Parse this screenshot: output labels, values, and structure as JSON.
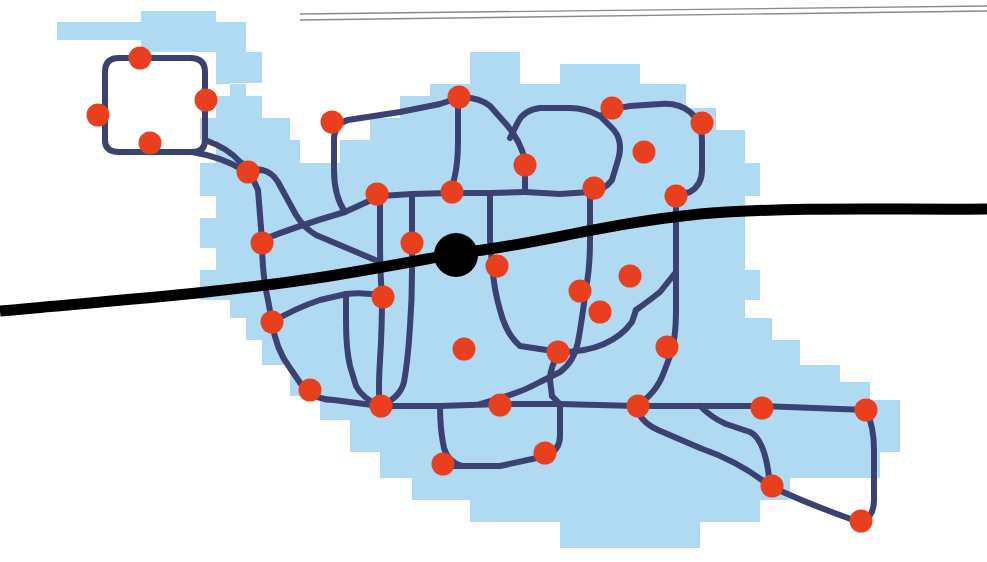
{
  "figure": {
    "width": 987,
    "height": 562,
    "background_color": "#ffffff"
  },
  "legend_colors": {
    "region_fill": "#b0daf1",
    "network_link": "#3b4271",
    "station_node": "#e8401e",
    "corridor": "#000000",
    "hub_node": "#000000",
    "rule": "#8a8a8a"
  },
  "layers": [
    {
      "name": "district-region",
      "label": "Shaded district area",
      "color": "#b0daf1"
    },
    {
      "name": "rail-network",
      "label": "Rail network links",
      "color": "#3b4271"
    },
    {
      "name": "stations",
      "label": "Stations",
      "color": "#e8401e"
    },
    {
      "name": "main-corridor",
      "label": "Main corridor",
      "color": "#000000"
    },
    {
      "name": "central-hub",
      "label": "Central hub",
      "color": "#000000"
    }
  ],
  "chart_data": {
    "type": "diagram",
    "region_polygon": "M 57,22 L 141,22 L 141,11 L 216,11 L 216,22 L 246,22 L 246,52 L 262,52 L 262,83 L 230,83 L 230,96 L 216,96 L 216,118 L 200,118 L 200,140 L 216,140 L 216,163 L 200,163 L 200,196 L 216,196 L 216,218 L 200,218 L 200,248 L 216,248 L 216,270 L 200,270 L 200,300 L 230,300 L 230,318 L 246,318 L 246,340 L 262,340 L 262,365 L 290,365 L 290,396 L 320,396 L 320,420 L 350,420 L 350,452 L 380,452 L 380,478 L 412,478 L 412,500 L 470,500 L 470,522 L 560,522 L 560,548 L 700,548 L 700,522 L 760,522 L 760,500 L 790,500 L 790,478 L 880,478 L 880,452 L 900,452 L 900,400 L 870,400 L 870,382 L 840,382 L 840,365 L 800,365 L 800,340 L 772,340 L 772,318 L 745,318 L 745,300 L 760,300 L 760,270 L 745,270 L 745,196 L 760,196 L 760,163 L 745,163 L 745,130 L 716,130 L 716,108 L 686,108 L 686,84 L 640,84 L 640,64 L 560,64 L 560,84 L 520,84 L 520,52 L 470,52 L 470,84 L 430,84 L 430,96 L 400,96 L 400,118 L 370,118 L 370,140 L 340,140 L 340,163 L 300,163 L 300,140 L 290,140 L 290,118 L 262,118 L 262,96 L 246,96 L 246,84 L 216,84 L 216,52 L 141,52 L 141,40 L 57,40 Z",
    "corridor_path": "M 0,311 C 120,300 230,292 330,276 C 420,261 450,254 475,251 C 540,243 610,223 700,214 C 800,206 900,210 987,209",
    "corridor_width": 11,
    "hub": {
      "x": 456,
      "y": 255,
      "r": 22,
      "label": "central-hub"
    },
    "rules": [
      {
        "x1": 300,
        "y1": 14,
        "x2": 987,
        "y2": 6,
        "width": 1.4
      },
      {
        "x1": 300,
        "y1": 20,
        "x2": 987,
        "y2": 11,
        "width": 1.4
      }
    ],
    "link_width": 6,
    "links": [
      "M 105,115 L 105,72 Q 105,58 119,58 L 190,58 Q 205,58 205,72 L 205,140 Q 205,152 192,152 L 162,152 L 119,152 Q 105,152 105,140 Z",
      "M 205,140 Q 228,148 240,162 L 248,172",
      "M 192,152 Q 222,157 243,170 L 252,178",
      "M 248,172 Q 254,180 258,190 L 262,240",
      "M 248,172 L 262,170 Q 272,172 278,182 L 296,215 Q 304,228 316,235 L 380,262",
      "M 262,240 Q 262,275 268,300 L 272,322",
      "M 272,322 Q 276,350 290,368 L 305,390",
      "M 305,390 Q 318,400 334,400 L 380,406",
      "M 380,406 L 440,406 L 500,404 L 560,404 L 636,406 L 700,406 L 762,406 L 866,410",
      "M 262,240 Q 300,225 345,212 L 380,196",
      "M 380,196 L 412,194 L 450,193 L 490,193 L 525,192",
      "M 380,196 L 380,240 Q 380,272 382,296",
      "M 382,296 Q 382,330 380,360 Q 378,392 380,406",
      "M 412,194 L 412,240 L 412,272",
      "M 412,272 Q 412,300 410,326 Q 408,360 404,382 Q 400,398 380,406",
      "M 345,212 Q 334,196 334,170 L 334,140 Q 334,124 348,120 L 400,112 Q 420,108 440,104 L 458,98",
      "M 458,98 Q 478,96 490,106 L 506,124 Q 520,140 525,160 L 525,192",
      "M 458,98 L 458,140 Q 458,170 452,186 L 450,193",
      "M 525,192 L 560,194 L 590,192",
      "M 590,192 Q 605,190 612,180 L 618,160 Q 624,140 612,128 L 600,116 Q 614,108 630,106 L 660,104 Q 678,102 690,112 Q 702,122 702,140 L 702,170 Q 702,185 690,192 L 676,196",
      "M 600,116 Q 585,108 570,108 L 540,108 Q 524,110 518,122 L 510,138",
      "M 590,192 L 590,240 Q 590,268 586,288",
      "M 586,288 Q 582,320 578,342 Q 574,362 560,372 L 540,382 Q 522,392 500,398 L 480,404",
      "M 676,196 L 676,240 L 676,272 L 676,310 Q 676,340 670,356 L 664,372 Q 656,394 636,406",
      "M 636,406 Q 640,422 658,430 L 700,448",
      "M 700,448 Q 740,462 770,486",
      "M 770,486 Q 810,505 862,523",
      "M 862,523 Q 874,516 874,500 L 874,450 Q 874,426 866,410",
      "M 700,406 Q 712,418 726,424 L 750,432 Q 766,440 770,486",
      "M 490,193 L 490,240 L 492,264",
      "M 492,264 Q 494,290 500,310 Q 506,334 520,346 L 560,352",
      "M 560,352 Q 586,352 604,344 Q 622,336 632,322 L 636,310",
      "M 636,310 Q 650,300 660,292 L 676,272",
      "M 560,352 Q 550,366 550,380 L 552,396",
      "M 552,396 L 560,404",
      "M 272,322 Q 296,308 320,300 L 346,294 Q 366,292 382,296",
      "M 262,170 Q 250,168 240,162",
      "M 346,294 L 346,322 Q 346,348 350,366 L 356,386 Q 362,398 380,406",
      "M 440,406 Q 440,430 444,448 Q 448,462 462,466 L 500,466 L 546,456 Q 560,450 560,436 L 560,416",
      "M 560,416 L 560,404",
      "M 462,466 L 440,466",
      "M 105,115 L 105,140",
      "M 700,406 L 762,406"
    ],
    "stations": [
      {
        "id": "s1",
        "x": 140,
        "y": 58,
        "label": "station-1"
      },
      {
        "id": "s2",
        "x": 98,
        "y": 115,
        "label": "station-2"
      },
      {
        "id": "s3",
        "x": 206,
        "y": 100,
        "label": "station-3"
      },
      {
        "id": "s4",
        "x": 150,
        "y": 143,
        "label": "station-4"
      },
      {
        "id": "s5",
        "x": 248,
        "y": 172,
        "label": "station-5"
      },
      {
        "id": "s6",
        "x": 332,
        "y": 122,
        "label": "station-6"
      },
      {
        "id": "s7",
        "x": 459,
        "y": 97,
        "label": "station-7"
      },
      {
        "id": "s8",
        "x": 612,
        "y": 108,
        "label": "station-8"
      },
      {
        "id": "s9",
        "x": 702,
        "y": 123,
        "label": "station-9"
      },
      {
        "id": "s10",
        "x": 525,
        "y": 165,
        "label": "station-10"
      },
      {
        "id": "s11",
        "x": 644,
        "y": 152,
        "label": "station-11"
      },
      {
        "id": "s12",
        "x": 377,
        "y": 194,
        "label": "station-12"
      },
      {
        "id": "s13",
        "x": 452,
        "y": 192,
        "label": "station-13"
      },
      {
        "id": "s14",
        "x": 594,
        "y": 188,
        "label": "station-14"
      },
      {
        "id": "s15",
        "x": 676,
        "y": 196,
        "label": "station-15"
      },
      {
        "id": "s16",
        "x": 262,
        "y": 243,
        "label": "station-16"
      },
      {
        "id": "s17",
        "x": 412,
        "y": 243,
        "label": "station-17"
      },
      {
        "id": "s18",
        "x": 497,
        "y": 266,
        "label": "station-18"
      },
      {
        "id": "s19",
        "x": 630,
        "y": 276,
        "label": "station-19"
      },
      {
        "id": "s20",
        "x": 272,
        "y": 322,
        "label": "station-20"
      },
      {
        "id": "s21",
        "x": 383,
        "y": 297,
        "label": "station-21"
      },
      {
        "id": "s22",
        "x": 580,
        "y": 291,
        "label": "station-22"
      },
      {
        "id": "s23",
        "x": 600,
        "y": 312,
        "label": "station-23"
      },
      {
        "id": "s24",
        "x": 464,
        "y": 349,
        "label": "station-24"
      },
      {
        "id": "s25",
        "x": 558,
        "y": 352,
        "label": "station-25"
      },
      {
        "id": "s26",
        "x": 667,
        "y": 347,
        "label": "station-26"
      },
      {
        "id": "s27",
        "x": 310,
        "y": 390,
        "label": "station-27"
      },
      {
        "id": "s28",
        "x": 381,
        "y": 406,
        "label": "station-28"
      },
      {
        "id": "s29",
        "x": 500,
        "y": 405,
        "label": "station-29"
      },
      {
        "id": "s30",
        "x": 638,
        "y": 406,
        "label": "station-30"
      },
      {
        "id": "s31",
        "x": 762,
        "y": 408,
        "label": "station-31"
      },
      {
        "id": "s32",
        "x": 866,
        "y": 410,
        "label": "station-32"
      },
      {
        "id": "s33",
        "x": 443,
        "y": 464,
        "label": "station-33"
      },
      {
        "id": "s34",
        "x": 545,
        "y": 453,
        "label": "station-34"
      },
      {
        "id": "s35",
        "x": 772,
        "y": 486,
        "label": "station-35"
      },
      {
        "id": "s36",
        "x": 861,
        "y": 521,
        "label": "station-36"
      }
    ],
    "station_radius": 11.5,
    "counts": {
      "stations": 36,
      "hubs": 1,
      "corridors": 1,
      "rules": 2
    }
  }
}
